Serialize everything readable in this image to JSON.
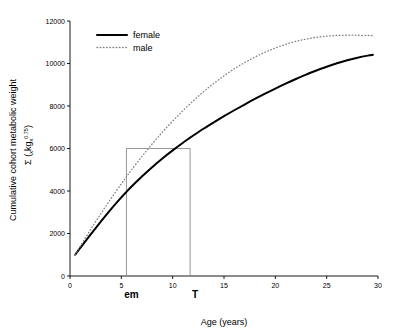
{
  "chart_data": {
    "type": "line",
    "title": "",
    "xlabel": "Age (years)",
    "ylabel_line1": "Cumulative cohort metabolic weight",
    "ylabel_line2_prefix": "Σ (",
    "ylabel_line2_sub1": "x",
    "ylabel_line2_mid": "kg",
    "ylabel_line2_sub2": "x",
    "ylabel_line2_sup": "0.75",
    "ylabel_line2_suffix": ")",
    "xlim": [
      0,
      30
    ],
    "ylim": [
      0,
      12000
    ],
    "xticks": [
      0,
      5,
      10,
      15,
      20,
      25,
      30
    ],
    "yticks": [
      0,
      2000,
      4000,
      6000,
      8000,
      10000,
      12000
    ],
    "xtick_labels": [
      "0",
      "5",
      "10",
      "15",
      "20",
      "25",
      "30"
    ],
    "ytick_labels": [
      "0",
      "2000",
      "4000",
      "6000",
      "8000",
      "10000",
      "12000"
    ],
    "grid": false,
    "legend_position": "top-left-inside",
    "colors": {
      "female_line": "#000000",
      "male_line": "#808080",
      "guide_line": "#8c8c8c",
      "axis": "#000000"
    },
    "series": [
      {
        "name": "female",
        "style": "solid",
        "color": "#000000",
        "x": [
          0.5,
          1,
          2,
          3,
          4,
          5,
          5.5,
          6,
          7,
          8,
          9,
          10,
          11,
          11.7,
          12,
          13,
          14,
          15,
          16,
          17,
          18,
          19,
          20,
          21,
          22,
          23,
          24,
          25,
          26,
          27,
          28,
          29,
          29.5
        ],
        "y": [
          1000,
          1320,
          1950,
          2560,
          3150,
          3700,
          3960,
          4210,
          4680,
          5120,
          5530,
          5910,
          6270,
          6510,
          6610,
          6930,
          7230,
          7520,
          7800,
          8070,
          8330,
          8580,
          8820,
          9050,
          9270,
          9480,
          9670,
          9850,
          10010,
          10150,
          10270,
          10370,
          10410
        ]
      },
      {
        "name": "male",
        "style": "dotted",
        "color": "#808080",
        "x": [
          0.5,
          1,
          2,
          3,
          4,
          5,
          5.5,
          6,
          7,
          8,
          9,
          10,
          11,
          12,
          13,
          14,
          15,
          16,
          17,
          18,
          19,
          20,
          21,
          22,
          23,
          24,
          25,
          26,
          27,
          28,
          29,
          29.5
        ],
        "y": [
          1000,
          1400,
          2180,
          2930,
          3650,
          4340,
          4670,
          5000,
          5620,
          6210,
          6770,
          7290,
          7780,
          8240,
          8670,
          9060,
          9420,
          9750,
          10040,
          10300,
          10530,
          10730,
          10900,
          11040,
          11150,
          11230,
          11290,
          11320,
          11330,
          11330,
          11320,
          11310
        ]
      }
    ],
    "legend": [
      {
        "label": "female",
        "style": "solid",
        "color": "#000000"
      },
      {
        "label": "male",
        "style": "dotted",
        "color": "#808080"
      }
    ],
    "annotations": [
      {
        "label": "em",
        "type": "x-marker",
        "x": 5.5,
        "y": 6000,
        "description": "male curve reaches 6000 at age 5.5"
      },
      {
        "label": "T",
        "type": "x-marker",
        "x": 11.7,
        "y": 6000,
        "description": "female curve reaches 6000 at age 11.7"
      }
    ],
    "guide_lines": {
      "y_value": 6000,
      "x_left": 5.5,
      "x_right": 11.7,
      "color": "#8c8c8c"
    }
  }
}
